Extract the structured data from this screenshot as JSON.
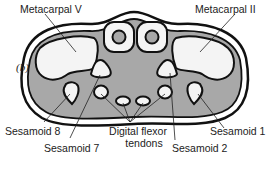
{
  "figure": {
    "panel_label": "(b)",
    "labels": {
      "metacarpal_v": "Metacarpal V",
      "metacarpal_ii": "Metacarpal II",
      "sesamoid_8": "Sesamoid 8",
      "sesamoid_7": "Sesamoid 7",
      "digital_flexor_line1": "Digital flexor",
      "digital_flexor_line2": "tendons",
      "sesamoid_2": "Sesamoid 2",
      "sesamoid_1": "Sesamoid 1"
    },
    "colors": {
      "outline": "#111111",
      "tissue_fill": "#a8a8a8",
      "bone_fill": "#f4f4f4",
      "skin_fill": "#ffffff"
    }
  }
}
